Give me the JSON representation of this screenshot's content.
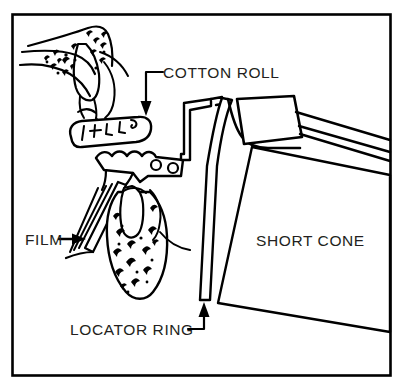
{
  "figure": {
    "frame": {
      "border_color": "#000000",
      "background_color": "#ffffff"
    },
    "ink_color": "#000000",
    "text_color": "#231f20",
    "labels": [
      {
        "id": "cotton-roll",
        "text": "COTTON ROLL",
        "pointer": "elbow-leader-down-arrow",
        "text_x": 163,
        "text_y": 78
      },
      {
        "id": "film",
        "text": "FILM",
        "pointer": "horizontal-right-arrow",
        "text_x": 25,
        "text_y": 243
      },
      {
        "id": "short-cone",
        "text": "SHORT CONE",
        "pointer": "none",
        "text_x": 256,
        "text_y": 245
      },
      {
        "id": "locator-ring",
        "text": "LOCATOR RING",
        "pointer": "elbow-leader-up-arrow",
        "text_x": 70,
        "text_y": 334
      }
    ],
    "parts": [
      {
        "id": "maxilla",
        "name": "upper-jaw-bone"
      },
      {
        "id": "maxillary-tooth",
        "name": "upper-tooth"
      },
      {
        "id": "cotton-roll-body",
        "name": "cotton-roll"
      },
      {
        "id": "bite-block",
        "name": "bite-block-holder"
      },
      {
        "id": "film-packet",
        "name": "film-packet"
      },
      {
        "id": "mandible",
        "name": "lower-jaw-bone"
      },
      {
        "id": "mandibular-tooth",
        "name": "lower-tooth"
      },
      {
        "id": "indicator-arm",
        "name": "indicator-rod-arm"
      },
      {
        "id": "locator-ring-body",
        "name": "locator-ring"
      },
      {
        "id": "short-cone-body",
        "name": "short-cone-pid"
      },
      {
        "id": "tubehead",
        "name": "x-ray-tubehead"
      }
    ]
  }
}
